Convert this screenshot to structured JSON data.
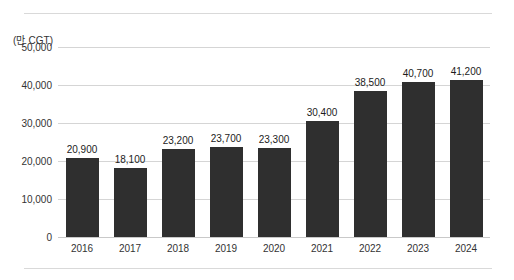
{
  "chart_data": {
    "type": "bar",
    "title": "",
    "subtitle": "",
    "unit_label": "(만 CGT)",
    "xlabel": "",
    "ylabel": "",
    "categories": [
      "2016",
      "2017",
      "2018",
      "2019",
      "2020",
      "2021",
      "2022",
      "2023",
      "2024"
    ],
    "values": [
      20900,
      18100,
      23200,
      23700,
      23300,
      30400,
      38500,
      40700,
      41200
    ],
    "value_labels": [
      "20,900",
      "18,100",
      "23,200",
      "23,700",
      "23,300",
      "30,400",
      "38,500",
      "40,700",
      "41,200"
    ],
    "ylim": [
      0,
      50000
    ],
    "yticks": [
      0,
      10000,
      20000,
      30000,
      40000,
      50000
    ],
    "ytick_labels": [
      "0",
      "10,000",
      "20,000",
      "30,000",
      "40,000",
      "50,000"
    ],
    "grid": true,
    "legend": "none",
    "series": [
      {
        "name": "",
        "values": [
          20900,
          18100,
          23200,
          23700,
          23300,
          30400,
          38500,
          40700,
          41200
        ]
      }
    ],
    "colors": {
      "bar": "#2f2f2f",
      "gridline": "#d5d5d5",
      "rule": "#d9d9d9",
      "text": "#333333",
      "value_label": "#1c1c1c",
      "background": "#ffffff"
    }
  }
}
